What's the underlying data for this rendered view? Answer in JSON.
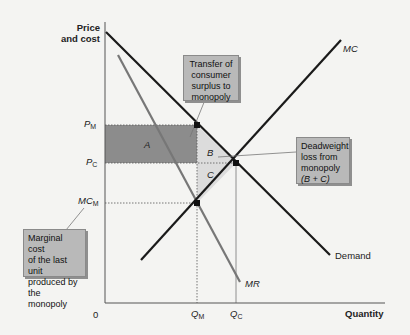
{
  "axes": {
    "y_title_line1": "Price",
    "y_title_line2": "and cost",
    "x_title": "Quantity",
    "origin": "0"
  },
  "ticks": {
    "pm": "P",
    "pm_sub": "M",
    "pc": "P",
    "pc_sub": "C",
    "mcm": "MC",
    "mcm_sub": "M",
    "qm": "Q",
    "qm_sub": "M",
    "qc": "Q",
    "qc_sub": "C"
  },
  "curves": {
    "mc": "MC",
    "mr": "MR",
    "demand": "Demand"
  },
  "regions": {
    "a": "A",
    "b": "B",
    "c": "C"
  },
  "callouts": {
    "transfer": [
      "Transfer of",
      "consumer",
      "surplus to",
      "monopoly"
    ],
    "deadweight": [
      "Deadweight",
      "loss from",
      "monopoly",
      "(B + C)"
    ],
    "marginal": [
      "Marginal cost",
      "of the last unit",
      "produced by",
      "the monopoly"
    ]
  },
  "colors": {
    "area_a": "#8c8c8c",
    "area_bc": "#dcdcdc",
    "curve_dark": "#1a1a1a",
    "curve_mr": "#777777",
    "callout_bg": "#b9b9b9"
  }
}
